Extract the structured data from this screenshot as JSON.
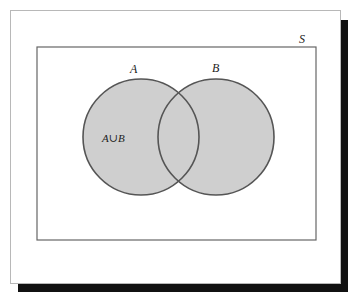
{
  "diagram": {
    "type": "venn",
    "universe_label": "S",
    "sets": [
      {
        "name": "A",
        "label": "A",
        "cx": 141,
        "cy": 137,
        "r": 58
      },
      {
        "name": "B",
        "label": "B",
        "cx": 216,
        "cy": 137,
        "r": 58
      }
    ],
    "region_label": "A∪B",
    "shaded_region": "A union B",
    "colors": {
      "fill": "#cfcfcf",
      "stroke": "#555555",
      "universe_stroke": "#666666",
      "frame_border": "#b8b8b8",
      "shadow": "#111111",
      "background": "#ffffff"
    }
  }
}
